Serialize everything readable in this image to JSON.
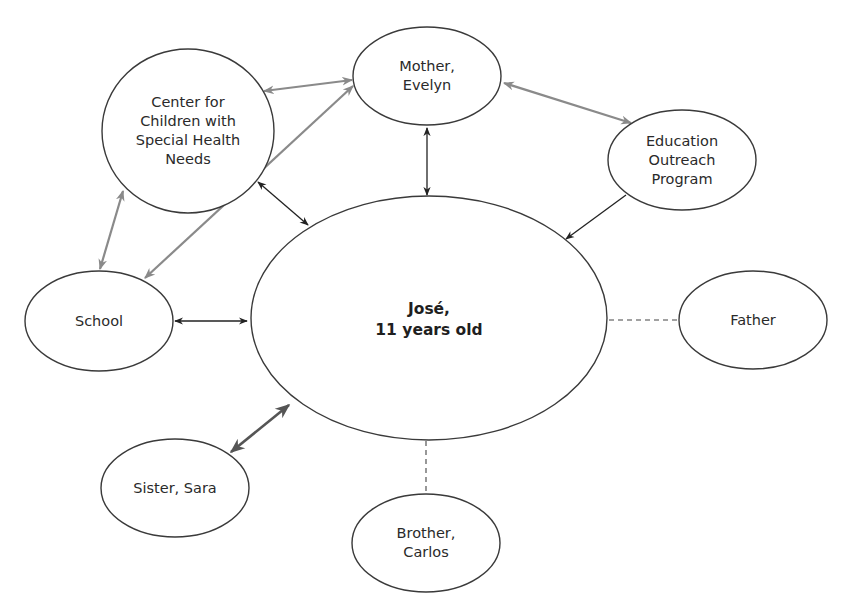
{
  "diagram": {
    "type": "ecomap",
    "center": {
      "id": "jose",
      "label": "José,\n11 years old"
    },
    "nodes": [
      {
        "id": "mother",
        "label": "Mother,\nEvelyn"
      },
      {
        "id": "center_children",
        "label": "Center for\nChildren with\nSpecial Health\nNeeds"
      },
      {
        "id": "education",
        "label": "Education\nOutreach\nProgram"
      },
      {
        "id": "school",
        "label": "School"
      },
      {
        "id": "father",
        "label": "Father"
      },
      {
        "id": "sister",
        "label": "Sister, Sara"
      },
      {
        "id": "brother",
        "label": "Brother,\nCarlos"
      }
    ],
    "edges": [
      {
        "from": "mother",
        "to": "jose",
        "style": "solid-dark",
        "direction": "both"
      },
      {
        "from": "center_children",
        "to": "jose",
        "style": "solid-dark",
        "direction": "both"
      },
      {
        "from": "education",
        "to": "jose",
        "style": "solid-dark",
        "direction": "to"
      },
      {
        "from": "school",
        "to": "jose",
        "style": "solid-dark",
        "direction": "both"
      },
      {
        "from": "sister",
        "to": "jose",
        "style": "thick-strong",
        "direction": "both"
      },
      {
        "from": "father",
        "to": "jose",
        "style": "dashed",
        "direction": "none"
      },
      {
        "from": "brother",
        "to": "jose",
        "style": "dashed",
        "direction": "none"
      },
      {
        "from": "center_children",
        "to": "mother",
        "style": "gray",
        "direction": "both"
      },
      {
        "from": "mother",
        "to": "education",
        "style": "gray",
        "direction": "both"
      },
      {
        "from": "center_children",
        "to": "school",
        "style": "gray",
        "direction": "both"
      },
      {
        "from": "mother",
        "to": "school",
        "style": "gray",
        "direction": "both"
      }
    ],
    "colors": {
      "stroke": "#3a3a3a",
      "edge_dark": "#222222",
      "edge_gray": "#8a8a8a",
      "edge_strong": "#555555",
      "background": "#ffffff"
    }
  }
}
